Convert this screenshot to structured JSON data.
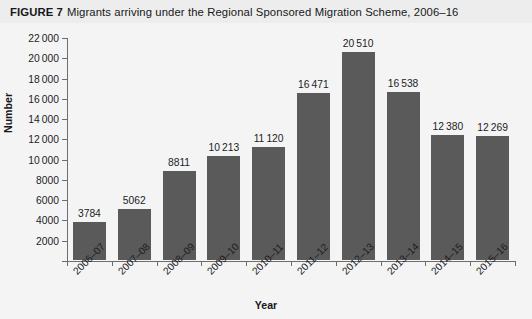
{
  "figure": {
    "label": "FIGURE 7",
    "caption": "Migrants arriving under the Regional Sponsored Migration Scheme, 2006–16"
  },
  "chart_data": {
    "type": "bar",
    "title": "Migrants arriving under the Regional Sponsored Migration Scheme, 2006–16",
    "xlabel": "Year",
    "ylabel": "Number",
    "ylim": [
      0,
      22000
    ],
    "ytick_step": 2000,
    "grid": false,
    "legend": null,
    "bar_color": "#5a5a5a",
    "categories": [
      "2006–07",
      "2007–08",
      "2008–09",
      "2009–10",
      "2010–11",
      "2011–12",
      "2012–13",
      "2013–14",
      "2014–15",
      "2015–16"
    ],
    "values": [
      3784,
      5062,
      8811,
      10213,
      11120,
      16471,
      20510,
      16538,
      12380,
      12269
    ],
    "value_labels": [
      "3784",
      "5062",
      "8811",
      "10 213",
      "11 120",
      "16 471",
      "20 510",
      "16 538",
      "12 380",
      "12 269"
    ],
    "ytick_values": [
      0,
      2000,
      4000,
      6000,
      8000,
      10000,
      12000,
      14000,
      16000,
      18000,
      20000,
      22000
    ],
    "ytick_labels": [
      "",
      "2000",
      "4000",
      "6000",
      "8000",
      "10 000",
      "12 000",
      "14 000",
      "16 000",
      "18 000",
      "20 000",
      "22 000"
    ]
  }
}
